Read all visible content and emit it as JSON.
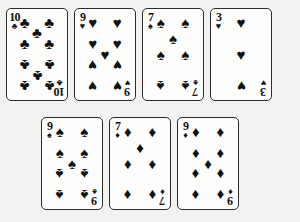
{
  "scene": {
    "title": "Seven playing cards laid out in two rows",
    "background_color": "#f2f2f0",
    "card_face_color": "#fdfdfb",
    "ink_color": "#111111",
    "card_count": 7
  },
  "glyphs": {
    "club": "♣",
    "heart": "♥",
    "spade": "♠",
    "diamond": "♦"
  },
  "rows": [
    {
      "name": "top-row",
      "card_count": 4
    },
    {
      "name": "bottom-row",
      "card_count": 3
    }
  ],
  "cards": [
    {
      "id": "card-1",
      "rank": "10",
      "suit": "clubs",
      "suit_symbol": "♣",
      "color": "black",
      "label": "10 of Clubs",
      "pip_count": 10,
      "row": "top",
      "position": 1
    },
    {
      "id": "card-2",
      "rank": "9",
      "suit": "hearts",
      "suit_symbol": "♥",
      "color": "black",
      "label": "9 of Hearts",
      "pip_count": 9,
      "row": "top",
      "position": 2
    },
    {
      "id": "card-3",
      "rank": "7",
      "suit": "spades",
      "suit_symbol": "♠",
      "color": "black",
      "label": "7 of Spades",
      "pip_count": 7,
      "row": "top",
      "position": 3
    },
    {
      "id": "card-4",
      "rank": "3",
      "suit": "hearts",
      "suit_symbol": "♥",
      "color": "black",
      "label": "3 of Hearts",
      "pip_count": 3,
      "row": "top",
      "position": 4
    },
    {
      "id": "card-5",
      "rank": "9",
      "suit": "spades",
      "suit_symbol": "♠",
      "color": "black",
      "label": "9 of Spades",
      "pip_count": 9,
      "row": "bottom",
      "position": 1
    },
    {
      "id": "card-6",
      "rank": "7",
      "suit": "diamonds",
      "suit_symbol": "♦",
      "color": "black",
      "label": "7 of Diamonds",
      "pip_count": 7,
      "row": "bottom",
      "position": 2
    },
    {
      "id": "card-7",
      "rank": "9",
      "suit": "diamonds",
      "suit_symbol": "♦",
      "color": "black",
      "label": "9 of Diamonds",
      "pip_count": 9,
      "row": "bottom",
      "position": 3
    }
  ],
  "pip_layouts": {
    "3": [
      [
        50,
        10,
        0
      ],
      [
        50,
        50,
        0
      ],
      [
        50,
        90,
        1
      ]
    ],
    "7": [
      [
        14,
        10,
        0
      ],
      [
        86,
        10,
        0
      ],
      [
        50,
        30,
        0
      ],
      [
        14,
        50,
        0
      ],
      [
        86,
        50,
        0
      ],
      [
        14,
        90,
        1
      ],
      [
        86,
        90,
        1
      ]
    ],
    "9": [
      [
        14,
        10,
        0
      ],
      [
        86,
        10,
        0
      ],
      [
        14,
        36,
        0
      ],
      [
        86,
        36,
        0
      ],
      [
        50,
        50,
        0
      ],
      [
        14,
        64,
        1
      ],
      [
        86,
        64,
        1
      ],
      [
        14,
        90,
        1
      ],
      [
        86,
        90,
        1
      ]
    ],
    "10": [
      [
        14,
        10,
        0
      ],
      [
        86,
        10,
        0
      ],
      [
        50,
        23,
        0
      ],
      [
        14,
        36,
        0
      ],
      [
        86,
        36,
        0
      ],
      [
        14,
        64,
        1
      ],
      [
        86,
        64,
        1
      ],
      [
        50,
        77,
        1
      ],
      [
        14,
        90,
        1
      ],
      [
        86,
        90,
        1
      ]
    ]
  }
}
